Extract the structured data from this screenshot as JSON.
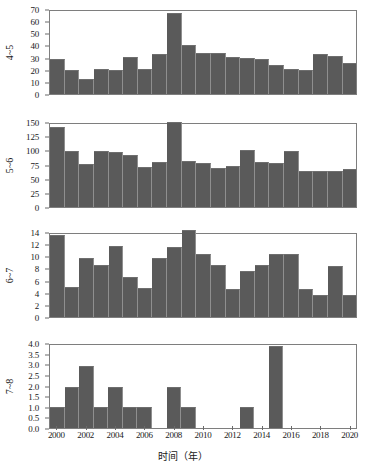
{
  "chart_data": {
    "type": "bar",
    "title": "",
    "xlabel": "时间（年）",
    "ylabel": "",
    "grid": false,
    "legend": "none",
    "x": [
      2000,
      2001,
      2002,
      2003,
      2004,
      2005,
      2006,
      2007,
      2008,
      2009,
      2010,
      2011,
      2012,
      2013,
      2014,
      2015,
      2016,
      2017,
      2018,
      2019,
      2020
    ],
    "xlim": [
      1999.5,
      2020.5
    ],
    "xticks": [
      "2000",
      "2002",
      "2004",
      "2006",
      "2008",
      "2010",
      "2012",
      "2014",
      "2016",
      "2018",
      "2020"
    ],
    "panels": [
      {
        "id": "panel-4-5",
        "ylabel": "4~5",
        "ylim": [
          0,
          70
        ],
        "yticks": [
          "0",
          "10",
          "20",
          "30",
          "40",
          "50",
          "60",
          "70"
        ],
        "ytickvalues": [
          0,
          10,
          20,
          30,
          40,
          50,
          60,
          70
        ],
        "values": [
          29.5,
          20.5,
          13,
          21.5,
          20,
          31,
          21,
          34,
          68,
          41,
          35,
          35,
          31.5,
          30,
          29.5,
          24.5,
          21.5,
          20,
          34,
          32,
          26
        ]
      },
      {
        "id": "panel-5-6",
        "ylabel": "5~6",
        "ylim": [
          0,
          150
        ],
        "yticks": [
          "0",
          "25",
          "50",
          "75",
          "100",
          "125",
          "150"
        ],
        "ytickvalues": [
          0,
          25,
          50,
          75,
          100,
          125,
          150
        ],
        "values": [
          144,
          102,
          78,
          101,
          99,
          94,
          73,
          81,
          154,
          83,
          80,
          70,
          75,
          103,
          82,
          79,
          101,
          65,
          65,
          65,
          68
        ]
      },
      {
        "id": "panel-6-7",
        "ylabel": "6~7",
        "ylim": [
          0,
          14
        ],
        "yticks": [
          "0",
          "2",
          "4",
          "6",
          "8",
          "10",
          "12",
          "14"
        ],
        "ytickvalues": [
          0,
          2,
          4,
          6,
          8,
          10,
          12,
          14
        ],
        "values": [
          13.9,
          5,
          9.9,
          8.8,
          11.9,
          6.8,
          4.9,
          9.9,
          11.8,
          14.7,
          10.7,
          8.7,
          4.8,
          7.8,
          8.7,
          10.7,
          10.6,
          4.7,
          3.7,
          8.6,
          3.7
        ]
      },
      {
        "id": "panel-7-8",
        "ylabel": "7~8",
        "ylim": [
          0,
          4
        ],
        "yticks": [
          "0.0",
          "0.5",
          "1.0",
          "1.5",
          "2.0",
          "2.5",
          "3.0",
          "3.5",
          "4.0"
        ],
        "ytickvalues": [
          0,
          0.5,
          1,
          1.5,
          2,
          2.5,
          3,
          3.5,
          4
        ],
        "values": [
          1,
          2,
          3,
          1,
          2,
          1,
          1,
          0,
          2,
          1,
          0,
          0,
          0,
          1,
          0,
          3.95,
          0,
          0,
          0,
          0,
          0
        ]
      }
    ],
    "colors": {
      "bar": "#5a5a5a",
      "axis": "#7e7e7e",
      "text": "#1a1a1a",
      "background": "#ffffff"
    }
  }
}
